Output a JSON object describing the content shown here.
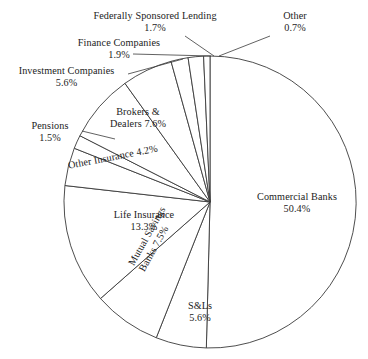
{
  "chart_data": {
    "type": "pie",
    "title": "",
    "subtitle": "",
    "xlabel": "",
    "ylabel": "",
    "units": "percent",
    "legend_position": "none",
    "grid": false,
    "start_angle_deg": 0,
    "direction": "clockwise",
    "total": 100.0,
    "categories": [
      "Commercial Banks",
      "S&Ls",
      "Mutual Savings Banks",
      "Life Insurance",
      "Other Insurance",
      "Pensions",
      "Brokers & Dealers",
      "Investment Companies",
      "Finance Companies",
      "Federally Sponsored Lending",
      "Other"
    ],
    "values": [
      50.4,
      5.6,
      7.5,
      13.3,
      4.2,
      1.5,
      7.6,
      5.6,
      1.9,
      1.7,
      0.7
    ],
    "slices": [
      {
        "label": "Commercial Banks",
        "value": 50.4,
        "pct_text": "50.4%",
        "label_placement": "inside"
      },
      {
        "label": "S&Ls",
        "value": 5.6,
        "pct_text": "5.6%",
        "label_placement": "inside"
      },
      {
        "label": "Mutual Savings Banks",
        "value": 7.5,
        "pct_text": "7.5%",
        "label_placement": "inside-rotated"
      },
      {
        "label": "Life Insurance",
        "value": 13.3,
        "pct_text": "13.3%",
        "label_placement": "inside"
      },
      {
        "label": "Other Insurance",
        "value": 4.2,
        "pct_text": "4.2%",
        "label_placement": "inside-rotated"
      },
      {
        "label": "Pensions",
        "value": 1.5,
        "pct_text": "1.5%",
        "label_placement": "outside-leader"
      },
      {
        "label": "Brokers & Dealers",
        "value": 7.6,
        "pct_text": "7.6%",
        "label_placement": "inside"
      },
      {
        "label": "Investment Companies",
        "value": 5.6,
        "pct_text": "5.6%",
        "label_placement": "outside-leader"
      },
      {
        "label": "Finance Companies",
        "value": 1.9,
        "pct_text": "1.9%",
        "label_placement": "outside-leader"
      },
      {
        "label": "Federally Sponsored Lending",
        "value": 1.7,
        "pct_text": "1.7%",
        "label_placement": "outside-leader"
      },
      {
        "label": "Other",
        "value": 0.7,
        "pct_text": "0.7%",
        "label_placement": "outside-leader"
      }
    ],
    "colors": {
      "slice_fill": "#ffffff",
      "slice_stroke": "#3a3a3a",
      "leader_line": "#3a3a3a",
      "text": "#1c1c1c",
      "background": "#ffffff"
    }
  },
  "labels": {
    "commercial_banks": {
      "name": "Commercial Banks",
      "pct": "50.4%"
    },
    "snls": {
      "name": "S&Ls",
      "pct": "5.6%"
    },
    "mutual_savings": {
      "name_line1": "Mutual Savings",
      "name_line2": "Banks 7.5%",
      "name": "Mutual Savings Banks",
      "pct": "7.5%"
    },
    "life_insurance": {
      "name": "Life Insurance",
      "pct": "13.3%"
    },
    "other_insurance": {
      "name": "Other Insurance 4.2%",
      "pct": "4.2%"
    },
    "pensions": {
      "name": "Pensions",
      "pct": "1.5%"
    },
    "brokers_dealers": {
      "name_line1": "Brokers &",
      "name_line2": "Dealers 7.6%",
      "name": "Brokers & Dealers",
      "pct": "7.6%"
    },
    "investment_cos": {
      "name": "Investment Companies",
      "pct": "5.6%"
    },
    "finance_cos": {
      "name": "Finance Companies",
      "pct": "1.9%"
    },
    "fed_sponsored": {
      "name": "Federally Sponsored Lending",
      "pct": "1.7%"
    },
    "other": {
      "name": "Other",
      "pct": "0.7%"
    }
  }
}
